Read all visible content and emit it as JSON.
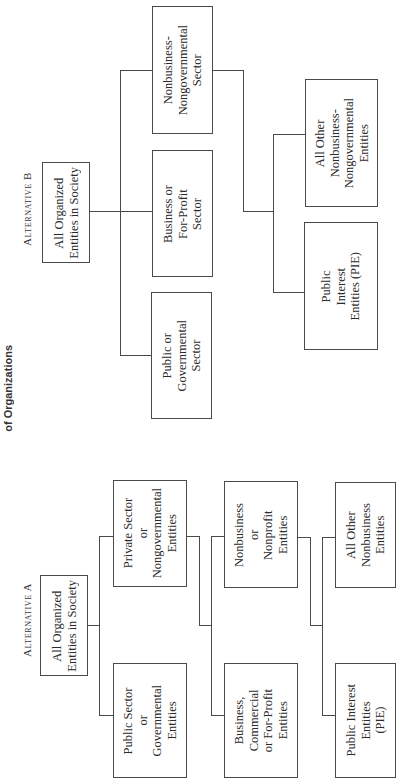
{
  "caption": "of Organizations",
  "alternative_b": {
    "label": "Alternative B",
    "root": "All Organized\nEntities in Society",
    "sectors": [
      {
        "id": "public",
        "text": "Public or\nGovernmental\nSector"
      },
      {
        "id": "business",
        "text": "Business or\nFor-Profit\nSector"
      },
      {
        "id": "nonbusiness",
        "text": "Nonbusiness-\nNongovernmental\nSector"
      }
    ],
    "subsectors": [
      {
        "id": "pie",
        "text": "Public\nInterest\nEntities (PIE)"
      },
      {
        "id": "all-other",
        "text": "All Other\nNonbusiness-\nNongovernmental\nEntities"
      }
    ]
  },
  "alternative_a": {
    "label": "Alternative A",
    "root": "All Organized\nEntities in Society",
    "level1": [
      {
        "id": "public",
        "text": "Public Sector\nor\nGovernmental\nEntities"
      },
      {
        "id": "private",
        "text": "Private Sector\nor\nNongovernmental\nEntities"
      }
    ],
    "level2": [
      {
        "id": "business",
        "text": "Business,\nCommercial\nor For-Profit\nEntities"
      },
      {
        "id": "nonprofit",
        "text": "Nonbusiness\nor\nNonprofit\nEntities"
      }
    ],
    "level3": [
      {
        "id": "pie",
        "text": "Public Interest\nEntities\n(PIE)"
      },
      {
        "id": "all-other",
        "text": "All Other\nNonbusiness\nEntities"
      }
    ]
  }
}
